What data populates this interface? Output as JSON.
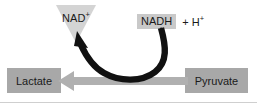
{
  "figure": {
    "name": "lactate-dehydrogenase-reaction-diagram",
    "background_color": "#ffffff",
    "width": 257,
    "height": 103
  },
  "cofactors": {
    "nad_oxidized": {
      "text": "NAD",
      "charge": "+",
      "shape": "down-triangle",
      "fill_color": "#d4d4d4"
    },
    "nadh_reduced": {
      "text": "NADH",
      "fill_color": "#c9c9c9"
    },
    "proton": {
      "plus": "+",
      "text": "H",
      "charge": "+"
    }
  },
  "metabolites": {
    "product": {
      "label": "Lactate",
      "fill_color": "#a8a8a8"
    },
    "substrate": {
      "label": "Pyruvate",
      "fill_color": "#a8a8a8"
    }
  },
  "arrows": {
    "reaction_arrow": {
      "direction": "right-to-left",
      "color": "#b0b0b0",
      "from": "Pyruvate",
      "to": "Lactate"
    },
    "cofactor_arrow": {
      "direction": "curved-right-to-left-upward",
      "color": "#111111",
      "from": "NADH",
      "to": "NAD+"
    }
  }
}
